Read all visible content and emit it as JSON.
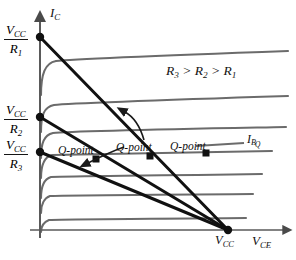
{
  "figure": {
    "axes": {
      "y_label": "I_C",
      "y_label_main": "I",
      "y_label_sub": "C",
      "x_label_main": "V",
      "x_label_sub": "CE",
      "x_origin_x": 40,
      "x_axis_y": 230,
      "x_axis_end": 288,
      "y_axis_top": 16
    },
    "y_ticks": [
      {
        "id": "tick-vcc-r1",
        "numerator": "V",
        "numerator_sub": "CC",
        "denominator": "R",
        "denominator_sub": "1",
        "y": 37,
        "label_x": 4,
        "label_y": 26
      },
      {
        "id": "tick-vcc-r2",
        "numerator": "V",
        "numerator_sub": "CC",
        "denominator": "R",
        "denominator_sub": "2",
        "y": 117,
        "label_x": 4,
        "label_y": 106
      },
      {
        "id": "tick-vcc-r3",
        "numerator": "V",
        "numerator_sub": "CC",
        "denominator": "R",
        "denominator_sub": "3",
        "y": 152,
        "label_x": 4,
        "label_y": 141
      }
    ],
    "x_tick": {
      "id": "tick-vcc",
      "main": "V",
      "sub": "CC",
      "x": 228,
      "y": 230,
      "label_x": 215,
      "label_y": 233
    },
    "annotations": {
      "resistor_relation": "R₃ > R₂ > R₁",
      "resistor_relation_parts": [
        "R",
        "3",
        " > ",
        "R",
        "2",
        " > ",
        "R",
        "1"
      ],
      "resistor_relation_x": 166,
      "resistor_relation_y": 64,
      "ibq_main": "I",
      "ibq_sub": "B",
      "ibq_sub2": "Q",
      "ibq_x": 248,
      "ibq_y": 140
    },
    "q_points": [
      {
        "id": "q-point-1",
        "label": "Q-point",
        "dot_x": 96,
        "dot_y": 159,
        "label_x": 58,
        "label_y": 145
      },
      {
        "id": "q-point-2",
        "label": "Q-point",
        "dot_x": 150,
        "dot_y": 156,
        "label_x": 116,
        "label_y": 142
      },
      {
        "id": "q-point-3",
        "label": "Q-point",
        "dot_x": 206,
        "dot_y": 153,
        "label_x": 170,
        "label_y": 141
      }
    ],
    "load_lines": [
      {
        "id": "load-line-r1",
        "from_x": 40,
        "from_y": 37,
        "to_x": 228,
        "to_y": 230
      },
      {
        "id": "load-line-r2",
        "from_x": 40,
        "from_y": 117,
        "to_x": 228,
        "to_y": 230
      },
      {
        "id": "load-line-r3",
        "from_x": 40,
        "from_y": 152,
        "to_x": 228,
        "to_y": 230
      }
    ],
    "characteristic_curves": [
      {
        "id": "ib-curve-1",
        "plateau_y": 61,
        "knee_x": 52,
        "end_x": 288
      },
      {
        "id": "ib-curve-2",
        "plateau_y": 105,
        "knee_x": 50,
        "end_x": 288
      },
      {
        "id": "ib-curve-3",
        "plateau_y": 133,
        "knee_x": 49,
        "end_x": 285
      },
      {
        "id": "ib-curve-4",
        "plateau_y": 155,
        "knee_x": 48,
        "end_x": 272
      },
      {
        "id": "ib-curve-5",
        "plateau_y": 177,
        "knee_x": 47,
        "end_x": 262
      },
      {
        "id": "ib-curve-6",
        "plateau_y": 196,
        "knee_x": 46,
        "end_x": 253
      },
      {
        "id": "ib-curve-7",
        "plateau_y": 220,
        "knee_x": 45,
        "end_x": 246
      }
    ],
    "pointer_arrows": [
      {
        "id": "arrow-to-qpoint-upper",
        "desc": "curved arrow pointing up-right toward load line"
      },
      {
        "id": "arrow-to-qpoint-lower",
        "desc": "curved arrow pointing down-left toward Q-point"
      }
    ],
    "colors": {
      "curve": "#6b6b6b",
      "load_line": "#111111",
      "axis": "#5a5a5a",
      "text": "#121212",
      "background": "#ffffff"
    }
  }
}
